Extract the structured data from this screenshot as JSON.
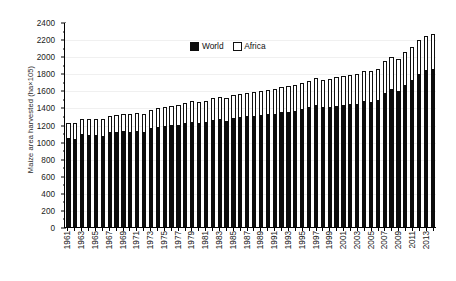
{
  "chart_data": {
    "type": "bar",
    "stacked": true,
    "title": "",
    "xlabel": "",
    "ylabel": "Maize area harvested (ha×105)",
    "ylim": [
      0,
      2400
    ],
    "ytick_step": 200,
    "yticks": [
      0,
      200,
      400,
      600,
      800,
      1000,
      1200,
      1400,
      1600,
      1800,
      2000,
      2200,
      2400
    ],
    "grid": "horizontal-faint",
    "legend_position": "top-center",
    "x": [
      1961,
      1962,
      1963,
      1964,
      1965,
      1966,
      1967,
      1968,
      1969,
      1970,
      1971,
      1972,
      1973,
      1974,
      1975,
      1976,
      1977,
      1978,
      1979,
      1980,
      1981,
      1982,
      1983,
      1984,
      1985,
      1986,
      1987,
      1988,
      1989,
      1990,
      1991,
      1992,
      1993,
      1994,
      1995,
      1996,
      1997,
      1998,
      1999,
      2000,
      2001,
      2002,
      2003,
      2004,
      2005,
      2006,
      2007,
      2008,
      2009,
      2010,
      2011,
      2012,
      2013,
      2014
    ],
    "xtick_labels": [
      "1961",
      "",
      "1963",
      "",
      "1965",
      "",
      "1967",
      "",
      "1969",
      "",
      "1971",
      "",
      "1973",
      "",
      "1975",
      "",
      "1977",
      "",
      "1979",
      "",
      "1981",
      "",
      "1983",
      "",
      "1985",
      "",
      "1987",
      "",
      "1989",
      "",
      "1991",
      "",
      "1993",
      "",
      "1995",
      "",
      "1997",
      "",
      "1999",
      "",
      "2001",
      "",
      "2003",
      "",
      "2005",
      "",
      "2007",
      "",
      "2009",
      "",
      "2011",
      "",
      "2013",
      ""
    ],
    "series": [
      {
        "name": "World",
        "color": "#0c0c0c",
        "values": [
          1045,
          1035,
          1085,
          1080,
          1080,
          1070,
          1110,
          1110,
          1120,
          1110,
          1125,
          1110,
          1155,
          1170,
          1185,
          1190,
          1195,
          1220,
          1235,
          1215,
          1230,
          1255,
          1270,
          1245,
          1280,
          1285,
          1300,
          1305,
          1310,
          1320,
          1325,
          1345,
          1350,
          1355,
          1380,
          1400,
          1425,
          1400,
          1405,
          1420,
          1430,
          1435,
          1440,
          1470,
          1465,
          1485,
          1570,
          1620,
          1590,
          1660,
          1720,
          1790,
          1835,
          1845
        ]
      },
      {
        "name": "Africa",
        "color": "#ffffff",
        "values": [
          170,
          180,
          175,
          185,
          190,
          195,
          195,
          200,
          205,
          210,
          210,
          215,
          215,
          220,
          225,
          230,
          235,
          235,
          240,
          245,
          250,
          250,
          255,
          260,
          265,
          270,
          270,
          275,
          280,
          285,
          290,
          290,
          300,
          305,
          310,
          315,
          320,
          325,
          330,
          335,
          340,
          345,
          350,
          355,
          360,
          365,
          370,
          375,
          380,
          385,
          390,
          395,
          400,
          410
        ]
      }
    ]
  },
  "legend": {
    "items": [
      {
        "label": "World",
        "swatch": "filled-black-square-icon"
      },
      {
        "label": "Africa",
        "swatch": "hollow-white-square-icon"
      }
    ]
  }
}
